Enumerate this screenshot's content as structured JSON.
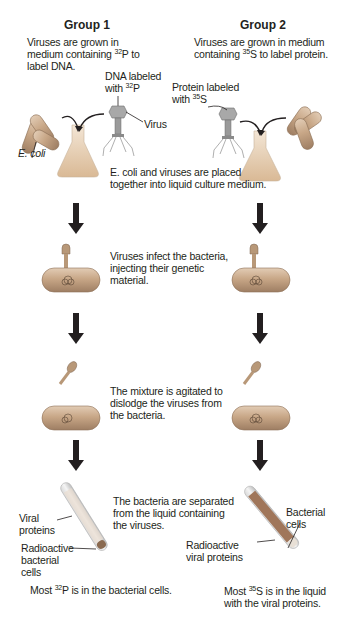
{
  "group1": {
    "title": "Group 1",
    "intro": {
      "pre": "Viruses are grown in medium containing ",
      "iso_mass": "32",
      "iso_sym": "P",
      "post": " to label DNA."
    },
    "dna_label": {
      "pre": "DNA labeled with ",
      "iso_mass": "32",
      "iso_sym": "P"
    },
    "virus_label": "Virus",
    "ecoli_label": "E. coli",
    "tube_labels": {
      "viral_proteins": "Viral proteins",
      "radioactive_cells": "Radioactive bacterial cells"
    },
    "result": {
      "pre": "Most ",
      "iso_mass": "32",
      "iso_sym": "P",
      "post": " is in the bacterial cells."
    }
  },
  "group2": {
    "title": "Group 2",
    "intro": {
      "pre": "Viruses are grown in medium containing ",
      "iso_mass": "35",
      "iso_sym": "S",
      "post": " to label protein."
    },
    "protein_label": {
      "pre": "Protein labeled with ",
      "iso_mass": "35",
      "iso_sym": "S"
    },
    "tube_labels": {
      "bacterial_cells": "Bacterial cells",
      "radioactive_proteins": "Radioactive viral proteins"
    },
    "result": {
      "pre": "Most ",
      "iso_mass": "35",
      "iso_sym": "S",
      "post": " is in the liquid with the viral proteins."
    }
  },
  "steps": [
    "E. coli and viruses are placed together into liquid culture medium.",
    "Viruses infect the bacteria, injecting their genetic material.",
    "The mixture is agitated to dislodge the viruses from the bacteria.",
    "The bacteria are separated from the liquid containing the viruses."
  ],
  "colors": {
    "text": "#231f20",
    "arrow": "#231f20",
    "bacterium": "#c9a98a",
    "flask": "#e6cdb0",
    "virus": "#9a9a9a"
  }
}
